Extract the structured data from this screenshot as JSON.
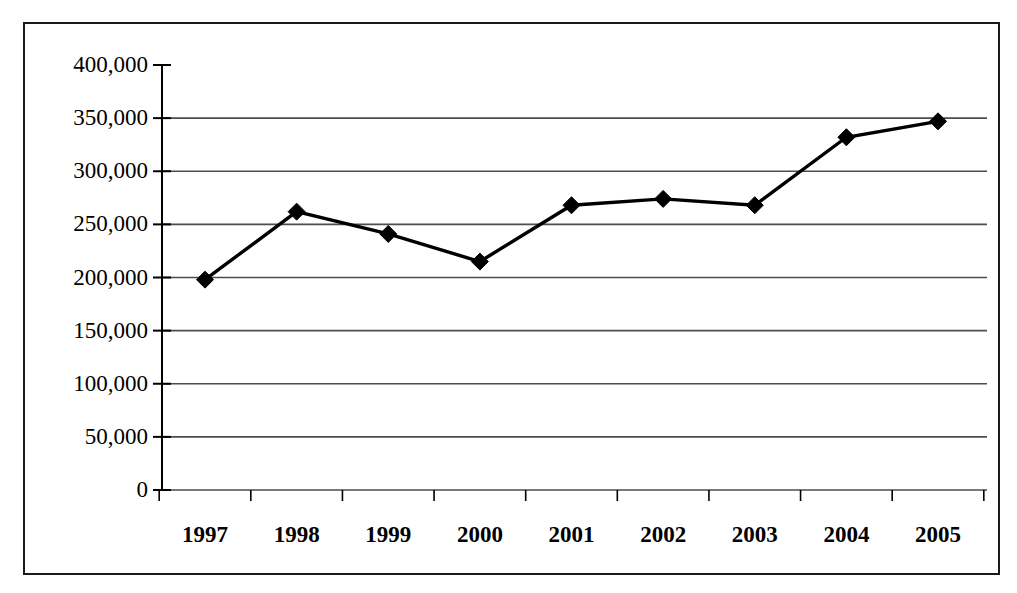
{
  "figure": {
    "background_color": "#ffffff",
    "border_color": "#1a1a1a",
    "line_color": "#000000",
    "marker_color": "#000000",
    "gridline_color": "#4d4d4d",
    "axis_color": "#000000"
  },
  "chart_data": {
    "type": "line",
    "title": "",
    "subtitle": "",
    "xlabel": "",
    "ylabel": "",
    "categories": [
      "1997",
      "1998",
      "1999",
      "2000",
      "2001",
      "2002",
      "2003",
      "2004",
      "2005"
    ],
    "values": [
      198000,
      262000,
      241000,
      215000,
      268000,
      274000,
      268000,
      332000,
      347000
    ],
    "series": [
      {
        "name": "",
        "values": [
          198000,
          262000,
          241000,
          215000,
          268000,
          274000,
          268000,
          332000,
          347000
        ],
        "marker": "diamond",
        "marker_color": "#000000",
        "line_color": "#000000"
      }
    ],
    "ylim": [
      0,
      400000
    ],
    "ytick_values": [
      0,
      50000,
      100000,
      150000,
      200000,
      250000,
      300000,
      350000,
      400000
    ],
    "ytick_labels": [
      "0",
      "50,000",
      "100,000",
      "150,000",
      "200,000",
      "250,000",
      "300,000",
      "350,000",
      "400,000"
    ],
    "xtick_labels": [
      "1997",
      "1998",
      "1999",
      "2000",
      "2001",
      "2002",
      "2003",
      "2004",
      "2005"
    ],
    "grid": true,
    "grid_axis": "y",
    "legend": false,
    "legend_position": "none"
  }
}
